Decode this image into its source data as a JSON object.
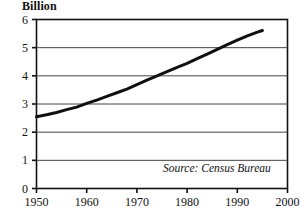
{
  "chart_data": {
    "type": "line",
    "title": "",
    "ylabel": "Billion",
    "xlabel": "",
    "ylim": [
      0,
      6
    ],
    "xlim": [
      1950,
      2000
    ],
    "grid": true,
    "legend": "none",
    "annotation": "Source: Census Bureau",
    "y_ticks": [
      "0",
      "1",
      "2",
      "3",
      "4",
      "5",
      "6"
    ],
    "y_tick_values": [
      0,
      1,
      2,
      3,
      4,
      5,
      6
    ],
    "x_ticks": [
      "1950",
      "1960",
      "1970",
      "1980",
      "1990",
      "2000"
    ],
    "x_tick_values": [
      1950,
      1960,
      1970,
      1980,
      1990,
      2000
    ],
    "series": [
      {
        "name": "World population",
        "x": [
          1950,
          1952,
          1954,
          1956,
          1958,
          1960,
          1962,
          1964,
          1966,
          1968,
          1970,
          1972,
          1974,
          1976,
          1978,
          1980,
          1982,
          1984,
          1986,
          1988,
          1990,
          1992,
          1994,
          1995
        ],
        "values": [
          2.55,
          2.62,
          2.7,
          2.8,
          2.89,
          3.02,
          3.14,
          3.27,
          3.4,
          3.53,
          3.69,
          3.85,
          4.0,
          4.15,
          4.3,
          4.44,
          4.61,
          4.77,
          4.94,
          5.11,
          5.27,
          5.42,
          5.55,
          5.61
        ],
        "color": "#101010",
        "linewidth": 3
      }
    ]
  },
  "axes": {
    "y_axis_title": "Billion"
  },
  "source": {
    "text": "Source: Census Bureau"
  }
}
